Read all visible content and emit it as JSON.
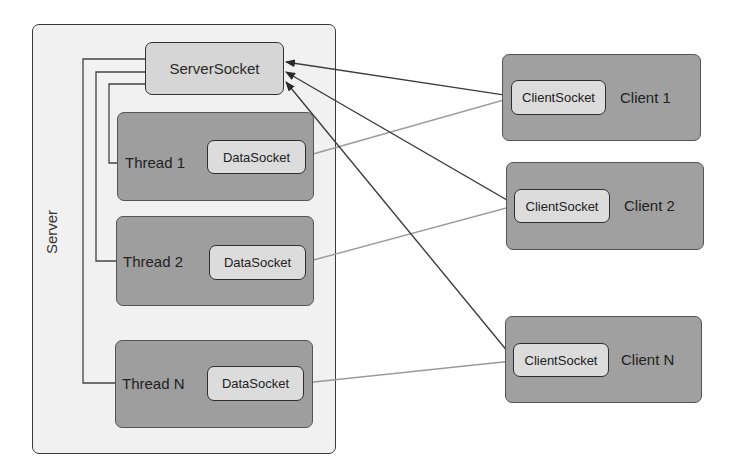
{
  "server": {
    "label": "Server",
    "server_socket": "ServerSocket",
    "threads": [
      {
        "label": "Thread 1",
        "socket": "DataSocket"
      },
      {
        "label": "Thread 2",
        "socket": "DataSocket"
      },
      {
        "label": "Thread N",
        "socket": "DataSocket"
      }
    ]
  },
  "clients": [
    {
      "label": "Client 1",
      "socket": "ClientSocket"
    },
    {
      "label": "Client 2",
      "socket": "ClientSocket"
    },
    {
      "label": "Client N",
      "socket": "ClientSocket"
    }
  ],
  "colors": {
    "server_bg": "#f1f1f1",
    "box_dark": "#9e9e9e",
    "socket_bg": "#dcdcdc",
    "connect_arrow": "#3c3c3c",
    "data_line": "#9a9a9a"
  }
}
